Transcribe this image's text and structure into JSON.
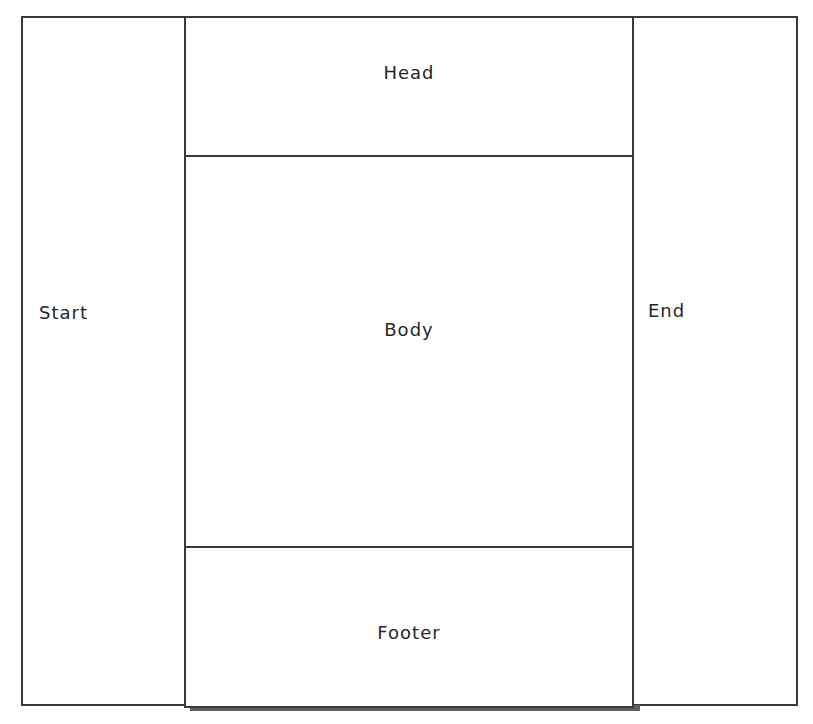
{
  "diagram": {
    "type": "layout-regions",
    "regions": {
      "start": {
        "label": "Start"
      },
      "head": {
        "label": "Head"
      },
      "body": {
        "label": "Body"
      },
      "footer": {
        "label": "Footer"
      },
      "end": {
        "label": "End"
      }
    },
    "colors": {
      "border": "#3a3a3a",
      "background": "#ffffff",
      "text": "#262626",
      "footer_shadow": "#5f5f5f"
    }
  }
}
